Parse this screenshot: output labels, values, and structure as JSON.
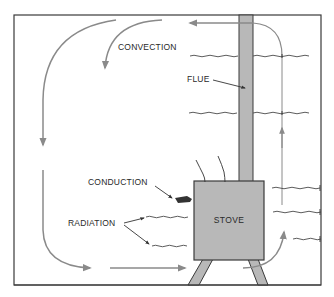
{
  "diagram": {
    "labels": {
      "convection": "CONVECTION",
      "flue": "FLUE",
      "conduction": "CONDUCTION",
      "radiation": "RADIATION",
      "stove": "STOVE"
    },
    "colors": {
      "background": "#ffffff",
      "outline": "#3a3a3a",
      "stove_fill": "#b8b8b8",
      "flue_fill": "#b8b8b8",
      "arrow": "#8a8a8a",
      "wave": "#4a4a4a"
    }
  }
}
